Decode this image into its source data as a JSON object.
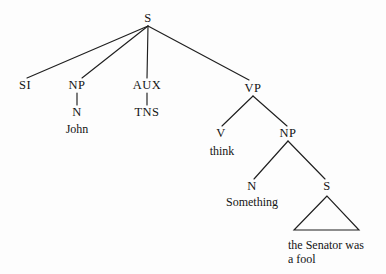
{
  "figure": {
    "kind": "syntax-tree-diagram",
    "background_color": "#fdfdfd",
    "line_color": "#1f1f1f",
    "text_color": "#141414",
    "width": 386,
    "height": 274
  },
  "nodes": {
    "root_s": "S",
    "si": "SI",
    "np_subject": "NP",
    "n_subject": "N",
    "aux": "AUX",
    "tns": "TNS",
    "vp": "VP",
    "v": "V",
    "np_object": "NP",
    "n_object": "N",
    "s_embedded": "S"
  },
  "terminals": {
    "john": "John",
    "think": "think",
    "something": "Something",
    "embedded_clause_line1": "the Senator was",
    "embedded_clause_line2": "a fool"
  },
  "layout": {
    "root_s": {
      "x": 148,
      "y": 18
    },
    "si": {
      "x": 25,
      "y": 85
    },
    "np_subject": {
      "x": 77,
      "y": 85
    },
    "n_subject": {
      "x": 77,
      "y": 112
    },
    "john": {
      "x": 77,
      "y": 129
    },
    "aux": {
      "x": 147,
      "y": 85
    },
    "tns": {
      "x": 147,
      "y": 112
    },
    "vp": {
      "x": 253,
      "y": 88
    },
    "v": {
      "x": 221,
      "y": 133
    },
    "think": {
      "x": 222,
      "y": 151
    },
    "np_object": {
      "x": 288,
      "y": 133
    },
    "n_object": {
      "x": 252,
      "y": 186
    },
    "something": {
      "x": 252,
      "y": 202
    },
    "s_embedded": {
      "x": 327,
      "y": 186
    },
    "triangle": {
      "apex_x": 327,
      "apex_y": 196,
      "left_x": 294,
      "right_x": 359,
      "base_y": 230
    },
    "embedded_text": {
      "x": 288,
      "y": 238
    }
  },
  "edges": [
    {
      "name": "s-to-si",
      "from": "root_s",
      "to": "si",
      "x1": 148,
      "y1": 26,
      "x2": 27,
      "y2": 78
    },
    {
      "name": "s-to-np-subject",
      "from": "root_s",
      "to": "np_subject",
      "x1": 148,
      "y1": 26,
      "x2": 82,
      "y2": 78
    },
    {
      "name": "s-to-aux",
      "from": "root_s",
      "to": "aux",
      "x1": 148,
      "y1": 26,
      "x2": 147,
      "y2": 78
    },
    {
      "name": "s-to-vp",
      "from": "root_s",
      "to": "vp",
      "x1": 148,
      "y1": 26,
      "x2": 249,
      "y2": 80
    },
    {
      "name": "np-subject-to-n",
      "from": "np_subject",
      "to": "n_subject",
      "x1": 77,
      "y1": 93,
      "x2": 77,
      "y2": 105
    },
    {
      "name": "aux-to-tns",
      "from": "aux",
      "to": "tns",
      "x1": 147,
      "y1": 93,
      "x2": 147,
      "y2": 105
    },
    {
      "name": "vp-to-v",
      "from": "vp",
      "to": "v",
      "x1": 253,
      "y1": 96,
      "x2": 222,
      "y2": 126
    },
    {
      "name": "vp-to-np-object",
      "from": "vp",
      "to": "np_object",
      "x1": 253,
      "y1": 96,
      "x2": 287,
      "y2": 126
    },
    {
      "name": "np-object-to-n",
      "from": "np_object",
      "to": "n_object",
      "x1": 288,
      "y1": 141,
      "x2": 254,
      "y2": 179
    },
    {
      "name": "np-object-to-s",
      "from": "np_object",
      "to": "s_embedded",
      "x1": 288,
      "y1": 141,
      "x2": 325,
      "y2": 179
    }
  ],
  "triangle": {
    "name": "embedded-clause-triangle",
    "points": "327,196 294,230 359,230"
  }
}
